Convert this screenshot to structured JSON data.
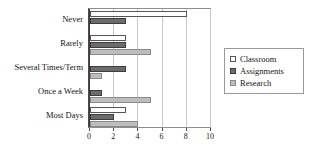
{
  "chart_data": {
    "type": "bar",
    "orientation": "horizontal",
    "title": "",
    "xlabel": "",
    "ylabel": "",
    "xlim": [
      0,
      10
    ],
    "xticks": [
      0,
      2,
      4,
      6,
      8,
      10
    ],
    "grid": true,
    "legend_position": "right",
    "categories": [
      "Never",
      "Rarely",
      "Several Times/Term",
      "Once a Week",
      "Most Days"
    ],
    "series": [
      {
        "name": "Classroom",
        "color": "#ffffff",
        "values": [
          8,
          3,
          0,
          0,
          3
        ]
      },
      {
        "name": "Assignments",
        "color": "#6c6c6c",
        "values": [
          3,
          3,
          3,
          1,
          2
        ]
      },
      {
        "name": "Research",
        "color": "#bdbdbd",
        "values": [
          0,
          5,
          1,
          5,
          4
        ]
      }
    ]
  },
  "legend": {
    "items": [
      {
        "label": "Classroom",
        "swatch": "legend-swatch-classroom"
      },
      {
        "label": "Assignments",
        "swatch": "legend-swatch-assignments"
      },
      {
        "label": "Research",
        "swatch": "legend-swatch-research"
      }
    ]
  }
}
